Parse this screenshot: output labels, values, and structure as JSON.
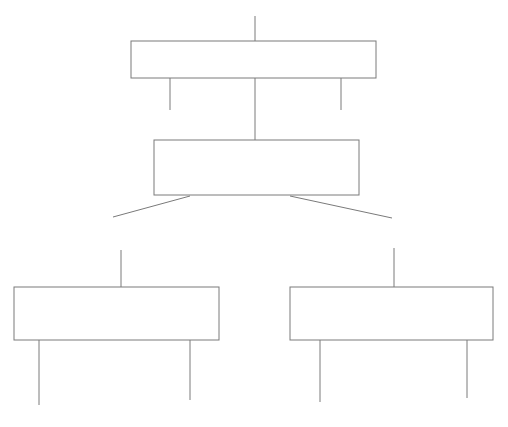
{
  "canvas": {
    "width": 508,
    "height": 427,
    "background": "#ffffff"
  },
  "style": {
    "stroke_color": "#7a7a7a",
    "box_fill": "#ffffff",
    "stroke_width": 1
  },
  "header": {
    "visible": false,
    "clipped_text": ""
  },
  "diagram": {
    "type": "hierarchy-tree",
    "title": "",
    "nodes": [
      {
        "id": "node-root",
        "label": "",
        "x": 131,
        "y": 41,
        "width": 245,
        "height": 37
      },
      {
        "id": "node-second",
        "label": "",
        "x": 154,
        "y": 140,
        "width": 205,
        "height": 55
      },
      {
        "id": "node-leaf-left",
        "label": "",
        "x": 14,
        "y": 287,
        "width": 205,
        "height": 53
      },
      {
        "id": "node-leaf-right",
        "label": "",
        "x": 290,
        "y": 287,
        "width": 203,
        "height": 53
      }
    ],
    "connectors": [
      {
        "id": "stem-root-top",
        "x1": 255,
        "y1": 16,
        "x2": 255,
        "y2": 41
      },
      {
        "id": "stem-root-down-left",
        "x1": 170,
        "y1": 78,
        "x2": 170,
        "y2": 110
      },
      {
        "id": "stem-root-down-center",
        "x1": 255,
        "y1": 78,
        "x2": 255,
        "y2": 140
      },
      {
        "id": "stem-root-down-right",
        "x1": 341,
        "y1": 78,
        "x2": 341,
        "y2": 110
      },
      {
        "id": "branch-second-left",
        "x1": 190,
        "y1": 196,
        "x2": 113,
        "y2": 217
      },
      {
        "id": "branch-second-right",
        "x1": 290,
        "y1": 196,
        "x2": 392,
        "y2": 218
      },
      {
        "id": "stem-leaf-left-top",
        "x1": 121,
        "y1": 250,
        "x2": 121,
        "y2": 287
      },
      {
        "id": "stem-leaf-right-top",
        "x1": 394,
        "y1": 248,
        "x2": 394,
        "y2": 287
      },
      {
        "id": "stem-leaf-left-down-a",
        "x1": 39,
        "y1": 340,
        "x2": 39,
        "y2": 405
      },
      {
        "id": "stem-leaf-left-down-b",
        "x1": 190,
        "y1": 340,
        "x2": 190,
        "y2": 400
      },
      {
        "id": "stem-leaf-right-down-a",
        "x1": 320,
        "y1": 340,
        "x2": 320,
        "y2": 402
      },
      {
        "id": "stem-leaf-right-down-b",
        "x1": 467,
        "y1": 340,
        "x2": 467,
        "y2": 398
      }
    ]
  }
}
